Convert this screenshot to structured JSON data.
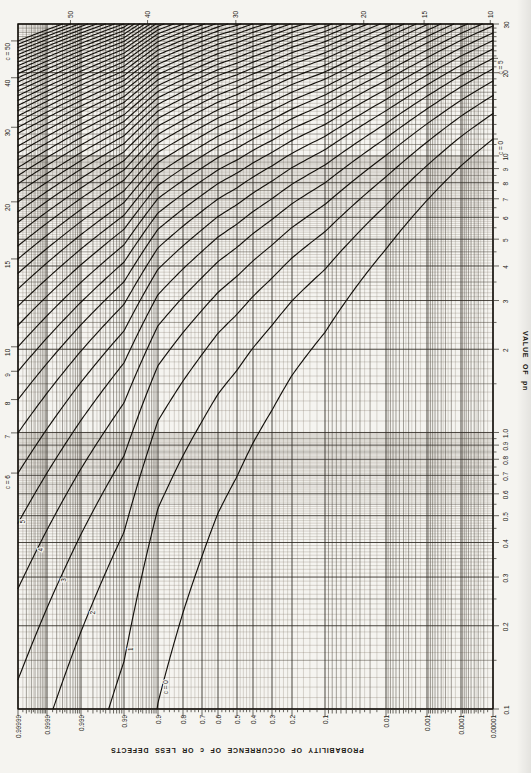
{
  "page": {
    "background": "#e9e7e2",
    "paper": "#f5f4f0",
    "ink": "#1b1813"
  },
  "chart_data": {
    "type": "line",
    "chart_family": "Thorndike chart - cumulative probability curves of the Poisson distribution",
    "formula": "P(c or less defects) = sum for k=0..c of exp(-pn) * (pn)^k / k!",
    "orientation": "landscape chart rotated 90 degrees counterclockwise on a portrait page",
    "titles": {
      "probability_axis": "PROBABILITY OF OCCURRENCE OF c OR LESS DEFECTS",
      "pn_axis": "VALUE OF pn"
    },
    "plot": {
      "left": 18,
      "top": 24,
      "right": 493,
      "bottom": 709
    },
    "pn_axis": {
      "scale": "log",
      "min": 0.1,
      "max": 30,
      "tick_labels": [
        {
          "v": 0.1,
          "t": "0.1"
        },
        {
          "v": 0.2,
          "t": "0.2"
        },
        {
          "v": 0.3,
          "t": "0.3"
        },
        {
          "v": 0.4,
          "t": "0.4"
        },
        {
          "v": 0.5,
          "t": "0.5"
        },
        {
          "v": 0.6,
          "t": "0.6"
        },
        {
          "v": 0.7,
          "t": "0.7"
        },
        {
          "v": 0.8,
          "t": "0.8"
        },
        {
          "v": 0.9,
          "t": "0.9"
        },
        {
          "v": 1,
          "t": "1.0"
        },
        {
          "v": 2,
          "t": "2"
        },
        {
          "v": 3,
          "t": "3"
        },
        {
          "v": 4,
          "t": "4"
        },
        {
          "v": 5,
          "t": "5"
        },
        {
          "v": 6,
          "t": "6"
        },
        {
          "v": 7,
          "t": "7"
        },
        {
          "v": 8,
          "t": "8"
        },
        {
          "v": 9,
          "t": "9"
        },
        {
          "v": 10,
          "t": "10"
        },
        {
          "v": 20,
          "t": "20"
        },
        {
          "v": 30,
          "t": "30"
        }
      ]
    },
    "probability_axis": {
      "scale": "probability scale (normal deviate), empirically anchored to the scan",
      "range_high": 0.99999,
      "range_low": 1e-05,
      "anchors": [
        [
          0.99999,
          18
        ],
        [
          0.9999,
          47
        ],
        [
          0.999,
          81
        ],
        [
          0.99,
          124
        ],
        [
          0.9,
          158
        ],
        [
          0.8,
          183
        ],
        [
          0.7,
          202
        ],
        [
          0.6,
          218
        ],
        [
          0.5,
          237
        ],
        [
          0.4,
          253
        ],
        [
          0.3,
          272
        ],
        [
          0.2,
          292
        ],
        [
          0.1,
          325
        ],
        [
          0.01,
          386
        ],
        [
          0.001,
          427
        ],
        [
          0.0001,
          461
        ],
        [
          1e-05,
          493
        ]
      ],
      "tick_labels": [
        {
          "p": 0.99999,
          "t": "0.99999"
        },
        {
          "p": 0.9999,
          "t": "0.9999"
        },
        {
          "p": 0.999,
          "t": "0.999"
        },
        {
          "p": 0.99,
          "t": "0.99"
        },
        {
          "p": 0.9,
          "t": "0.9"
        },
        {
          "p": 0.8,
          "t": "0.8"
        },
        {
          "p": 0.7,
          "t": "0.7"
        },
        {
          "p": 0.6,
          "t": "0.6"
        },
        {
          "p": 0.5,
          "t": "0.5"
        },
        {
          "p": 0.4,
          "t": "0.4"
        },
        {
          "p": 0.3,
          "t": "0.3"
        },
        {
          "p": 0.2,
          "t": "0.2"
        },
        {
          "p": 0.1,
          "t": "0.1"
        },
        {
          "p": 0.01,
          "t": "0.01"
        },
        {
          "p": 0.001,
          "t": "0.001"
        },
        {
          "p": 0.0001,
          "t": "0.0001"
        },
        {
          "p": 1e-05,
          "t": "0.00001"
        }
      ]
    },
    "curves": {
      "c_values": [
        0,
        1,
        2,
        3,
        4,
        5,
        6,
        7,
        8,
        9,
        10,
        11,
        12,
        13,
        14,
        15,
        16,
        17,
        18,
        19,
        20,
        21,
        22,
        23,
        24,
        25,
        26,
        27,
        28,
        29,
        30,
        31,
        32,
        33,
        34,
        35,
        36,
        37,
        38,
        39,
        40,
        41,
        42,
        43,
        44,
        45,
        46,
        47,
        48,
        49,
        50
      ]
    },
    "curve_labels": {
      "left_edge": [
        {
          "c": 50,
          "text": "c = 50"
        },
        {
          "c": 40,
          "text": "40"
        },
        {
          "c": 30,
          "text": "30"
        },
        {
          "c": 20,
          "text": "20"
        },
        {
          "c": 15,
          "text": "15"
        },
        {
          "c": 10,
          "text": "10"
        },
        {
          "c": 9,
          "text": "9"
        },
        {
          "c": 8,
          "text": "8"
        },
        {
          "c": 7,
          "text": "7"
        },
        {
          "c": 6,
          "text": "c = 6"
        }
      ],
      "top_edge": [
        {
          "c": 50,
          "text": "50"
        },
        {
          "c": 40,
          "text": "40"
        },
        {
          "c": 30,
          "text": "30"
        },
        {
          "c": 20,
          "text": "20"
        },
        {
          "c": 15,
          "text": "15"
        },
        {
          "c": 10,
          "text": "10"
        }
      ],
      "right_edge": [
        {
          "c": 5,
          "text": "c = 5"
        },
        {
          "c": 0,
          "text": "c = 0"
        }
      ],
      "inline": [
        {
          "c": 5,
          "text": "5",
          "pn": 0.48
        },
        {
          "c": 4,
          "text": "4",
          "pn": 0.38
        },
        {
          "c": 3,
          "text": "3",
          "pn": 0.295
        },
        {
          "c": 2,
          "text": "2",
          "pn": 0.225
        },
        {
          "c": 1,
          "text": "1",
          "pn": 0.166
        },
        {
          "c": 0,
          "text": "c = 0",
          "pn": 0.121
        }
      ]
    },
    "style": {
      "curve_color": "#14110c",
      "curve_width": 1.15,
      "grid_major": "#2a261f",
      "grid_major_w": 0.85,
      "grid_medium": "#4c463c",
      "grid_medium_w": 0.5,
      "grid_minor": "#837c6e",
      "grid_minor_w": 0.3,
      "frame_color": "#14110c",
      "frame_w": 1.5,
      "label_size": 6.4
    }
  }
}
